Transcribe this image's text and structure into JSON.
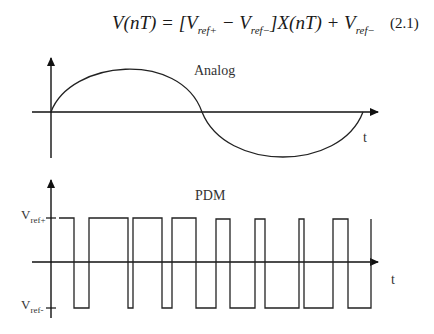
{
  "equation": {
    "lhs": "V(nT)",
    "rhs_prefix": " = [V",
    "ref_plus": "ref+",
    "minus": " − V",
    "ref_minus": "ref−",
    "rhs_mid": "]X(nT) + V",
    "ref_minus2": "ref−",
    "number": "(2.1)"
  },
  "analog": {
    "title": "Analog",
    "t_label": "t"
  },
  "pdm": {
    "title": "PDM",
    "t_label": "t",
    "vref_plus": "V",
    "vref_plus_sub": "ref+",
    "vref_minus": "V",
    "vref_minus_sub": "ref-",
    "transitions_x": [
      59,
      74,
      89,
      128,
      133,
      162,
      172,
      196,
      216,
      230,
      255,
      265,
      299,
      304,
      333,
      348,
      371
    ]
  }
}
